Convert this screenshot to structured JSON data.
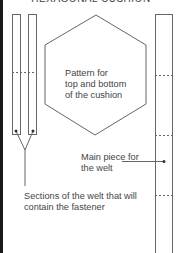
{
  "header": {
    "title": "HEXAGONAL CUSHION"
  },
  "labels": {
    "hexagon": [
      "Pattern for",
      "top and bottom",
      "of the cushion"
    ],
    "main_piece": [
      "Main piece for",
      "the welt"
    ],
    "sections": [
      "Sections of the welt that will",
      "contain the fastener"
    ]
  },
  "colors": {
    "line": "#666666",
    "text": "#444444",
    "edge": "#1a1a1a"
  }
}
